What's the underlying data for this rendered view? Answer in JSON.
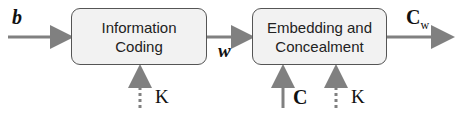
{
  "diagram": {
    "blocks": [
      {
        "id": "information-coding",
        "line1": "Information",
        "line2": "Coding"
      },
      {
        "id": "embedding-concealment",
        "line1": "Embedding and",
        "line2": "Concealment"
      }
    ],
    "labels": {
      "input_b": "b",
      "intermediate_w": "w",
      "output_c": "C",
      "output_c_sub": "w",
      "cover_c": "C",
      "key1": "K",
      "key2": "K"
    },
    "colors": {
      "arrow": "#808080",
      "box_fill": "#f2f2f2",
      "box_border": "#555555"
    }
  }
}
